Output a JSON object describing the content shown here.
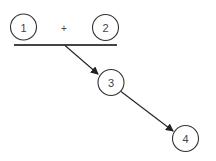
{
  "diagram": {
    "nodes": [
      {
        "id": "1",
        "label": "1",
        "cx": 23.5,
        "cy": 27,
        "r": 13
      },
      {
        "id": "2",
        "label": "2",
        "cx": 105.5,
        "cy": 27.5,
        "r": 13
      },
      {
        "id": "3",
        "label": "3",
        "cx": 111,
        "cy": 82.5,
        "r": 13
      },
      {
        "id": "4",
        "label": "4",
        "cx": 185.5,
        "cy": 138.5,
        "r": 13
      }
    ],
    "operator": {
      "label": "+",
      "x": 64,
      "y": 28.5
    },
    "combine_bar": {
      "x1": 14,
      "y1": 45,
      "x2": 117,
      "y2": 45
    },
    "edges": [
      {
        "from": "1+2",
        "to": "3",
        "x1": 65,
        "y1": 45.5,
        "x2": 98,
        "y2": 74
      },
      {
        "from": "3",
        "to": "4",
        "x1": 121,
        "y1": 91.5,
        "x2": 173,
        "y2": 131
      }
    ]
  }
}
